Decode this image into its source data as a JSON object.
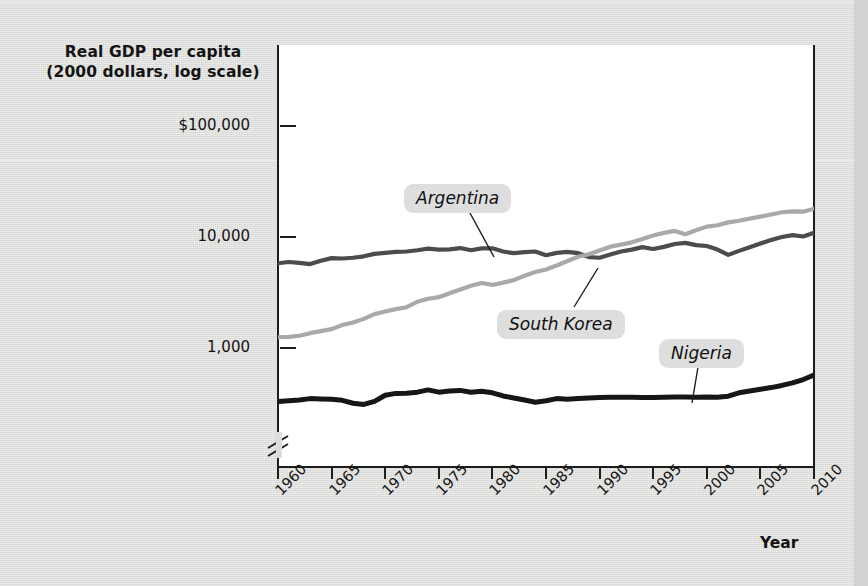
{
  "figure": {
    "y_axis_title_line1": "Real GDP per capita",
    "y_axis_title_line2": "(2000 dollars, log scale)",
    "x_axis_title": "Year"
  },
  "colors": {
    "argentina": "#4c4c4c",
    "south_korea": "#a9a9a9",
    "nigeria": "#161616",
    "axis": "#1d1d1d",
    "page_background": "#dcdcda",
    "plot_background": "#ffffff",
    "callout_background": "#dedede"
  },
  "callouts": [
    {
      "label": "Argentina",
      "x": 404,
      "y": 184,
      "line_x1": 470,
      "line_y1": 213,
      "line_x2": 494,
      "line_y2": 257
    },
    {
      "label": "South Korea",
      "x": 497,
      "y": 310,
      "line_x1": 574,
      "line_y1": 307,
      "line_x2": 598,
      "line_y2": 268
    },
    {
      "label": "Nigeria",
      "x": 659,
      "y": 339,
      "line_x1": 698,
      "line_y1": 367,
      "line_x2": 692,
      "line_y2": 403
    }
  ],
  "chart_data": {
    "type": "line",
    "title": "Real GDP per capita (2000 dollars, log scale)",
    "xlabel": "Year",
    "ylabel": "Real GDP per capita (2000 dollars, log scale)",
    "y_scale": "log",
    "y_axis_broken": true,
    "ylim": [
      230,
      100000
    ],
    "xlim": [
      1960,
      2010
    ],
    "grid": false,
    "legend": "inline-callouts",
    "y_ticks": [
      {
        "label": "$100,000",
        "value": 100000
      },
      {
        "label": "10,000",
        "value": 10000
      },
      {
        "label": "1,000",
        "value": 1000
      }
    ],
    "x_ticks": [
      "1960",
      "1965",
      "1970",
      "1975",
      "1980",
      "1985",
      "1990",
      "1995",
      "2000",
      "2005",
      "2010"
    ],
    "x": [
      1960,
      1961,
      1962,
      1963,
      1964,
      1965,
      1966,
      1967,
      1968,
      1969,
      1970,
      1971,
      1972,
      1973,
      1974,
      1975,
      1976,
      1977,
      1978,
      1979,
      1980,
      1981,
      1982,
      1983,
      1984,
      1985,
      1986,
      1987,
      1988,
      1989,
      1990,
      1991,
      1992,
      1993,
      1994,
      1995,
      1996,
      1997,
      1998,
      1999,
      2000,
      2001,
      2002,
      2003,
      2004,
      2005,
      2006,
      2007,
      2008,
      2009,
      2010
    ],
    "series": [
      {
        "name": "Argentina",
        "color": "#4c4c4c",
        "values": [
          5800,
          5950,
          5850,
          5700,
          6100,
          6450,
          6400,
          6500,
          6700,
          7050,
          7200,
          7350,
          7400,
          7600,
          7850,
          7700,
          7750,
          7950,
          7600,
          7900,
          7900,
          7400,
          7150,
          7300,
          7400,
          6850,
          7200,
          7350,
          7150,
          6600,
          6500,
          6950,
          7400,
          7700,
          8100,
          7800,
          8150,
          8650,
          8850,
          8450,
          8300,
          7700,
          6900,
          7500,
          8100,
          8750,
          9400,
          10000,
          10400,
          10100,
          10900
        ]
      },
      {
        "name": "South Korea",
        "color": "#a9a9a9",
        "values": [
          1250,
          1260,
          1290,
          1360,
          1420,
          1480,
          1610,
          1700,
          1830,
          2020,
          2130,
          2240,
          2330,
          2610,
          2780,
          2870,
          3110,
          3370,
          3640,
          3850,
          3700,
          3880,
          4090,
          4470,
          4830,
          5100,
          5540,
          6080,
          6640,
          7000,
          7570,
          8180,
          8530,
          8950,
          9600,
          10300,
          10900,
          11350,
          10600,
          11500,
          12400,
          12750,
          13550,
          14000,
          14650,
          15250,
          15950,
          16700,
          17000,
          16900,
          18000
        ]
      },
      {
        "name": "Nigeria",
        "color": "#161616",
        "values": [
          330,
          335,
          340,
          350,
          348,
          345,
          338,
          318,
          310,
          330,
          375,
          390,
          392,
          400,
          420,
          400,
          410,
          415,
          400,
          408,
          395,
          370,
          355,
          340,
          325,
          335,
          350,
          345,
          350,
          355,
          358,
          360,
          360,
          360,
          358,
          358,
          360,
          362,
          362,
          360,
          362,
          360,
          368,
          395,
          410,
          425,
          440,
          460,
          485,
          520,
          570
        ]
      }
    ]
  }
}
